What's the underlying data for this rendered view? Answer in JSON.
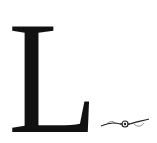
{
  "dropcap": {
    "letter": "L",
    "color": "#111111"
  },
  "ornament": {
    "icon": "floral-flourish-icon",
    "color": "#222222"
  }
}
